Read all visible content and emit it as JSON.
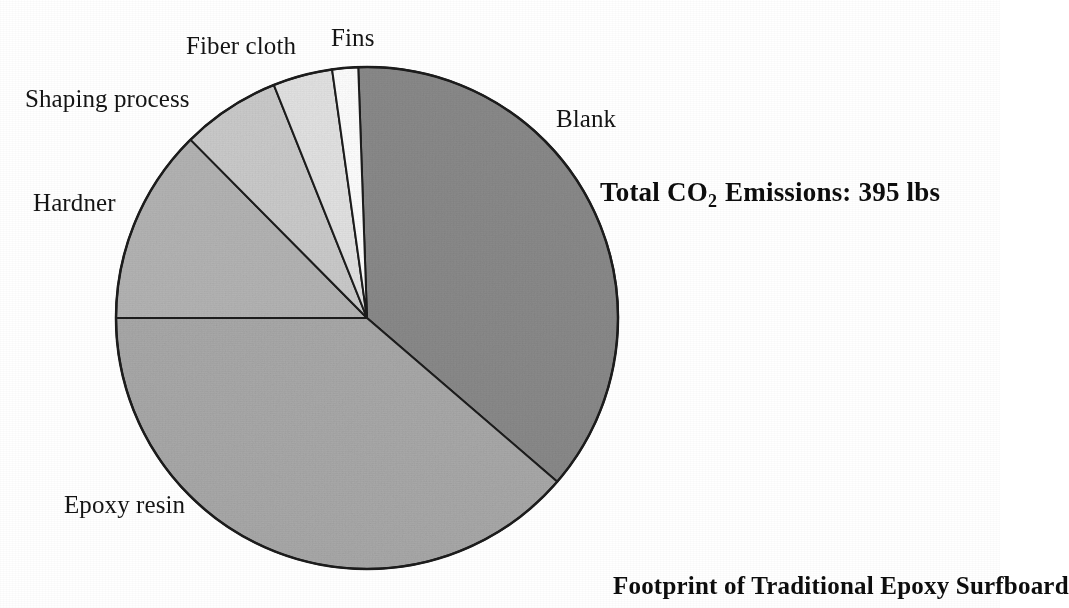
{
  "figure": {
    "background": "#ffffff",
    "caption": "Footprint of Traditional Epoxy Surfboard",
    "total_label": "Total CO",
    "total_sub": "2",
    "total_rest": " Emissions: 395 lbs"
  },
  "chart_data": {
    "type": "pie",
    "title": "Footprint of Traditional Epoxy Surfboard",
    "subtitle": "Total CO2 Emissions: 395 lbs",
    "unit": "lbs CO2",
    "total": 395,
    "total_text": "395 lbs",
    "start_angle_deg": -2,
    "direction": "clockwise",
    "grid": false,
    "legend": "none (direct labels around pie)",
    "labels": [
      "Blank",
      "Epoxy resin",
      "Hardner",
      "Shaping process",
      "Fiber cloth",
      "Fins"
    ],
    "values": [
      146,
      153,
      50,
      25,
      15,
      6
    ],
    "percentages": [
      36.9,
      38.7,
      12.6,
      6.4,
      3.8,
      1.7
    ],
    "angles_deg": [
      132.7,
      139.3,
      45.3,
      22.9,
      13.8,
      6.0
    ],
    "colors": [
      "#8a8a8a",
      "#a9a9a9",
      "#b4b4b4",
      "#cbcbcb",
      "#e3e3e3",
      "#ffffff"
    ],
    "slices": [
      {
        "label": "Blank",
        "value": 146,
        "percent": 36.9,
        "angle": 132.7,
        "color": "#8a8a8a"
      },
      {
        "label": "Epoxy resin",
        "value": 153,
        "percent": 38.7,
        "angle": 139.3,
        "color": "#a9a9a9"
      },
      {
        "label": "Hardner",
        "value": 50,
        "percent": 12.6,
        "angle": 45.3,
        "color": "#b4b4b4"
      },
      {
        "label": "Shaping process",
        "value": 25,
        "percent": 6.4,
        "angle": 22.9,
        "color": "#cbcbcb"
      },
      {
        "label": "Fiber cloth",
        "value": 15,
        "percent": 3.8,
        "angle": 13.8,
        "color": "#e3e3e3"
      },
      {
        "label": "Fins",
        "value": 6,
        "percent": 1.7,
        "angle": 6.0,
        "color": "#ffffff"
      }
    ]
  },
  "labels": {
    "blank": "Blank",
    "epoxy_resin": "Epoxy resin",
    "hardner": "Hardner",
    "shaping_process": "Shaping process",
    "fiber_cloth": "Fiber cloth",
    "fins": "Fins"
  },
  "geometry": {
    "center_x": 367,
    "center_y": 318,
    "radius": 251
  }
}
